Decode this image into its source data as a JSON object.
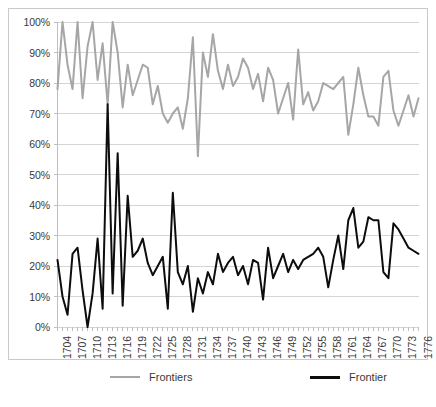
{
  "chart_data": {
    "type": "line",
    "title": "",
    "xlabel": "",
    "ylabel": "",
    "ylim": [
      0,
      1
    ],
    "ytick_labels": [
      "0%",
      "10%",
      "20%",
      "30%",
      "40%",
      "50%",
      "60%",
      "70%",
      "80%",
      "90%",
      "100%"
    ],
    "ytick_values": [
      0,
      10,
      20,
      30,
      40,
      50,
      60,
      70,
      80,
      90,
      100
    ],
    "grid": "horizontal",
    "legend_position": "bottom",
    "x_tick_label_interval": 3,
    "x_first_label": "1704",
    "x_last_label": "1776",
    "x": [
      1704,
      1705,
      1706,
      1707,
      1708,
      1709,
      1710,
      1711,
      1712,
      1713,
      1714,
      1715,
      1716,
      1717,
      1718,
      1719,
      1720,
      1721,
      1722,
      1723,
      1724,
      1725,
      1726,
      1727,
      1728,
      1729,
      1730,
      1731,
      1732,
      1733,
      1734,
      1735,
      1736,
      1737,
      1738,
      1739,
      1740,
      1741,
      1742,
      1743,
      1744,
      1745,
      1746,
      1747,
      1748,
      1749,
      1750,
      1751,
      1752,
      1753,
      1754,
      1755,
      1756,
      1757,
      1758,
      1759,
      1760,
      1761,
      1762,
      1763,
      1764,
      1765,
      1766,
      1767,
      1768,
      1769,
      1770,
      1771,
      1772,
      1773,
      1774,
      1775,
      1776
    ],
    "xtick_labels": [
      "1704",
      "1707",
      "1710",
      "1713",
      "1716",
      "1719",
      "1722",
      "1725",
      "1728",
      "1731",
      "1734",
      "1737",
      "1740",
      "1743",
      "1746",
      "1749",
      "1752",
      "1755",
      "1758",
      "1761",
      "1764",
      "1767",
      "1770",
      "1773",
      "1776"
    ],
    "series": [
      {
        "name": "Frontiers",
        "color": "#a6a6a6",
        "width": 2,
        "values": [
          78,
          100,
          86,
          78,
          100,
          75,
          92,
          100,
          81,
          93,
          73,
          100,
          90,
          72,
          86,
          76,
          81,
          86,
          85,
          73,
          79,
          70,
          67,
          70,
          72,
          65,
          75,
          95,
          56,
          90,
          82,
          96,
          84,
          78,
          86,
          79,
          82,
          88,
          85,
          78,
          83,
          74,
          85,
          81,
          70,
          75,
          80,
          68,
          91,
          73,
          77,
          71,
          74,
          80,
          79,
          78,
          80,
          82,
          63,
          73,
          85,
          76,
          69,
          69,
          66,
          82,
          84,
          71,
          66,
          71,
          76,
          69,
          75
        ]
      },
      {
        "name": "Frontier",
        "color": "#0d0d0d",
        "width": 2,
        "values": [
          22,
          10,
          4,
          24,
          26,
          12,
          0,
          11,
          29,
          6,
          73,
          11,
          57,
          7,
          43,
          23,
          25,
          29,
          21,
          17,
          20,
          23,
          6,
          44,
          18,
          14,
          20,
          5,
          16,
          11,
          18,
          14,
          24,
          18,
          21,
          23,
          17,
          20,
          14,
          22,
          21,
          9,
          26,
          16,
          20,
          24,
          18,
          22,
          19,
          22,
          23,
          24,
          26,
          23,
          13,
          22,
          30,
          19,
          35,
          39,
          26,
          28,
          36,
          35,
          35,
          18,
          16,
          34,
          32,
          29,
          26,
          25,
          24
        ]
      }
    ]
  },
  "legend": {
    "items": [
      {
        "label": "Frontiers",
        "color": "#a6a6a6",
        "width": 2
      },
      {
        "label": "Frontier",
        "color": "#0d0d0d",
        "width": 3
      }
    ]
  },
  "colors": {
    "grid": "#d4d4d4",
    "axis": "#bfbfbf",
    "border": "#c9c9c9",
    "text": "#3a3a3a",
    "background": "#ffffff"
  }
}
